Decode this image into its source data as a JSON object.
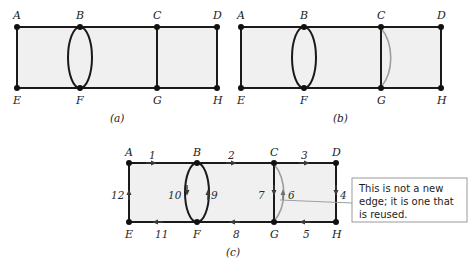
{
  "figure": {
    "title_panels": [
      "(a)",
      "(b)",
      "(c)"
    ],
    "vertex_labels": [
      "A",
      "B",
      "C",
      "D",
      "E",
      "F",
      "G",
      "H"
    ],
    "callout": {
      "lines": [
        "This is not a new",
        "edge; it is one that",
        "is reused."
      ],
      "full_text": "This is not a new edge; it is one that is reused."
    },
    "colors": {
      "face_fill": "#f0f0f0",
      "edge": "#1a1a1a",
      "reused_edge": "#9e9e9e",
      "node": "#111111",
      "callout_border": "#9a9a9a",
      "background": "#ffffff"
    }
  },
  "panel_a": {
    "caption": "(a)",
    "vertices": [
      {
        "id": "A",
        "label": "A",
        "x": 17,
        "y": 27
      },
      {
        "id": "B",
        "label": "B",
        "x": 80,
        "y": 27
      },
      {
        "id": "C",
        "label": "C",
        "x": 157,
        "y": 27
      },
      {
        "id": "D",
        "label": "D",
        "x": 217,
        "y": 27
      },
      {
        "id": "E",
        "label": "E",
        "x": 17,
        "y": 88
      },
      {
        "id": "F",
        "label": "F",
        "x": 80,
        "y": 88
      },
      {
        "id": "G",
        "label": "G",
        "x": 157,
        "y": 88
      },
      {
        "id": "H",
        "label": "H",
        "x": 217,
        "y": 88
      }
    ],
    "edges": [
      "A-B",
      "B-C",
      "C-D",
      "E-F",
      "F-G",
      "G-H",
      "A-E",
      "C-G",
      "D-H"
    ],
    "highlight": {
      "type": "ellipse",
      "between": "B-F",
      "style": "black"
    }
  },
  "panel_b": {
    "caption": "(b)",
    "vertices": [
      {
        "id": "A",
        "label": "A",
        "x": 241,
        "y": 27
      },
      {
        "id": "B",
        "label": "B",
        "x": 304,
        "y": 27
      },
      {
        "id": "C",
        "label": "C",
        "x": 381,
        "y": 27
      },
      {
        "id": "D",
        "label": "D",
        "x": 441,
        "y": 27
      },
      {
        "id": "E",
        "label": "E",
        "x": 241,
        "y": 88
      },
      {
        "id": "F",
        "label": "F",
        "x": 304,
        "y": 88
      },
      {
        "id": "G",
        "label": "G",
        "x": 381,
        "y": 88
      },
      {
        "id": "H",
        "label": "H",
        "x": 441,
        "y": 88
      }
    ],
    "edges": [
      "A-B",
      "B-C",
      "C-D",
      "E-F",
      "F-G",
      "G-H",
      "A-E",
      "C-G",
      "D-H"
    ],
    "highlight": {
      "type": "ellipse",
      "between": "B-F",
      "style": "black"
    },
    "reused_arc": {
      "between": "C-G",
      "style": "gray",
      "bulge": "right"
    }
  },
  "panel_c": {
    "caption": "(c)",
    "vertices": [
      {
        "id": "A",
        "label": "A",
        "x": 129,
        "y": 163
      },
      {
        "id": "B",
        "label": "B",
        "x": 197,
        "y": 163
      },
      {
        "id": "C",
        "label": "C",
        "x": 274,
        "y": 163
      },
      {
        "id": "D",
        "label": "D",
        "x": 336,
        "y": 163
      },
      {
        "id": "E",
        "label": "E",
        "x": 129,
        "y": 222
      },
      {
        "id": "F",
        "label": "F",
        "x": 197,
        "y": 222
      },
      {
        "id": "G",
        "label": "G",
        "x": 274,
        "y": 222
      },
      {
        "id": "H",
        "label": "H",
        "x": 336,
        "y": 222
      }
    ],
    "numbered_edges": [
      {
        "number": "1",
        "from": "A",
        "to": "B",
        "label_x": 152,
        "label_y": 158,
        "direction": "right"
      },
      {
        "number": "2",
        "from": "B",
        "to": "C",
        "label_x": 231,
        "label_y": 158,
        "direction": "right"
      },
      {
        "number": "3",
        "from": "C",
        "to": "D",
        "label_x": 304,
        "label_y": 158,
        "direction": "right"
      },
      {
        "number": "4",
        "from": "D",
        "to": "H",
        "label_x": 342,
        "label_y": 196,
        "direction": "down"
      },
      {
        "number": "5",
        "from": "H",
        "to": "G",
        "label_x": 306,
        "label_y": 234,
        "direction": "left"
      },
      {
        "number": "6",
        "from": "G",
        "to": "C",
        "label_x": 290,
        "label_y": 196,
        "direction": "up",
        "reused": true
      },
      {
        "number": "7",
        "from": "C",
        "to": "G",
        "label_x": 260,
        "label_y": 196,
        "direction": "down"
      },
      {
        "number": "8",
        "from": "G",
        "to": "F",
        "label_x": 236,
        "label_y": 234,
        "direction": "left"
      },
      {
        "number": "9",
        "from": "F",
        "to": "B",
        "label_x": 213,
        "label_y": 196,
        "direction": "up"
      },
      {
        "number": "10",
        "from": "B",
        "to": "F",
        "label_x": 174,
        "label_y": 196,
        "direction": "down"
      },
      {
        "number": "11",
        "from": "F",
        "to": "E",
        "label_x": 159,
        "label_y": 234,
        "direction": "left"
      },
      {
        "number": "12",
        "from": "E",
        "to": "A",
        "label_x": 117,
        "label_y": 196,
        "direction": "up"
      }
    ],
    "callout_lines": [
      "This is not a new",
      "edge; it is one that",
      "is reused."
    ],
    "callout_box": {
      "x": 352,
      "y": 178,
      "width": 115,
      "height": 44
    }
  }
}
